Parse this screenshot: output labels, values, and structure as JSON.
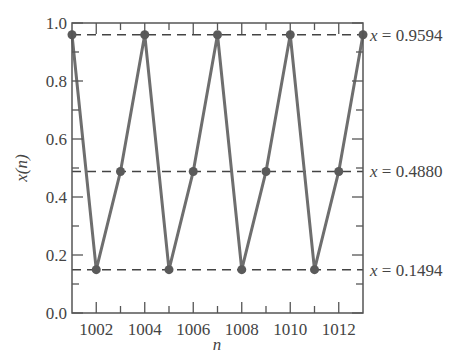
{
  "chart_data": {
    "type": "line",
    "title": "",
    "xlabel": "n",
    "ylabel": "x(n)",
    "xlim": [
      1001,
      1013
    ],
    "ylim": [
      0.0,
      1.0
    ],
    "x_ticks": [
      1002,
      1004,
      1006,
      1008,
      1010,
      1012
    ],
    "x_tick_labels": [
      "1002",
      "1004",
      "1006",
      "1008",
      "1010",
      "1012"
    ],
    "x_minor_ticks": [
      1003,
      1005,
      1007,
      1009,
      1011
    ],
    "y_ticks": [
      0.0,
      0.2,
      0.4,
      0.6,
      0.8,
      1.0
    ],
    "y_tick_labels": [
      "0.0",
      "0.2",
      "0.4",
      "0.6",
      "0.8",
      "1.0"
    ],
    "y_minor_ticks": [
      0.1,
      0.3,
      0.5,
      0.7,
      0.9
    ],
    "grid": false,
    "series": [
      {
        "name": "x(n)",
        "x": [
          1001,
          1002,
          1003,
          1004,
          1005,
          1006,
          1007,
          1008,
          1009,
          1010,
          1011,
          1012,
          1013
        ],
        "values": [
          0.9594,
          0.1494,
          0.488,
          0.9594,
          0.1494,
          0.488,
          0.9594,
          0.1494,
          0.488,
          0.9594,
          0.1494,
          0.488,
          0.9594
        ],
        "color": "#6e6e6e",
        "marker": "circle"
      }
    ],
    "reference_lines": [
      {
        "y": 0.9594,
        "style": "dashed",
        "label": "x = 0.9594"
      },
      {
        "y": 0.488,
        "style": "dashed",
        "label": "x = 0.4880"
      },
      {
        "y": 0.1494,
        "style": "dashed",
        "label": "x = 0.1494"
      }
    ],
    "annotations": [
      {
        "var": "x",
        "text": " = 0.9594"
      },
      {
        "var": "x",
        "text": " = 0.4880"
      },
      {
        "var": "x",
        "text": " = 0.1494"
      }
    ]
  }
}
